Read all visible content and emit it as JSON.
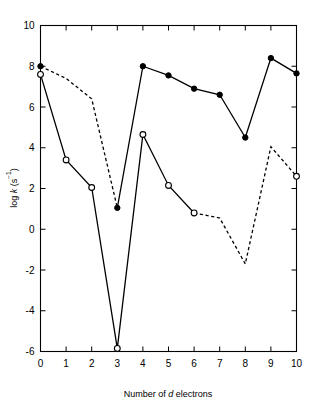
{
  "chart_data": {
    "type": "line",
    "title": "",
    "xlabel": "Number of d electrons",
    "xlabel_parts": {
      "prefix": "Number of ",
      "italic": "d",
      "suffix": " electrons"
    },
    "ylabel": "log k (s−1)",
    "ylabel_parts": {
      "prefix": "log ",
      "italic": "k",
      "suffix": " (s"
    },
    "ylabel_superscript": "−1",
    "ylabel_close": ")",
    "xlim": [
      0,
      10
    ],
    "ylim": [
      -6,
      10
    ],
    "xticks": [
      0,
      1,
      2,
      3,
      4,
      5,
      6,
      7,
      8,
      9,
      10
    ],
    "yticks": [
      10,
      8,
      6,
      4,
      2,
      0,
      -2,
      -4,
      -6
    ],
    "xtick_labels": [
      "0",
      "1",
      "2",
      "3",
      "4",
      "5",
      "6",
      "7",
      "8",
      "9",
      "10"
    ],
    "ytick_labels": [
      "10",
      "8",
      "6",
      "4",
      "2",
      "0",
      "-2",
      "-4",
      "-6"
    ],
    "grid": false,
    "legend": "none",
    "frame": "box",
    "tick_direction": "in",
    "x": [
      0,
      1,
      2,
      3,
      4,
      5,
      6,
      7,
      8,
      9,
      10
    ],
    "series": [
      {
        "name": "filled-circle-series",
        "marker": "filled-circle",
        "linestyle_segments": [
          {
            "from_x": 0,
            "to_x": 3,
            "style": "dashed"
          },
          {
            "from_x": 3,
            "to_x": 10,
            "style": "solid"
          }
        ],
        "points": [
          {
            "x": 0,
            "y": 8.0,
            "marker": true
          },
          {
            "x": 1,
            "y": 7.4,
            "marker": false
          },
          {
            "x": 2,
            "y": 6.4,
            "marker": false
          },
          {
            "x": 3,
            "y": 1.05,
            "marker": true
          },
          {
            "x": 4,
            "y": 8.0,
            "marker": true
          },
          {
            "x": 5,
            "y": 7.55,
            "marker": true
          },
          {
            "x": 6,
            "y": 6.9,
            "marker": true
          },
          {
            "x": 7,
            "y": 6.6,
            "marker": true
          },
          {
            "x": 8,
            "y": 4.5,
            "marker": true
          },
          {
            "x": 9,
            "y": 8.4,
            "marker": true
          },
          {
            "x": 10,
            "y": 7.65,
            "marker": true
          }
        ]
      },
      {
        "name": "open-circle-series",
        "marker": "open-circle",
        "linestyle_segments": [
          {
            "from_x": 0,
            "to_x": 6,
            "style": "solid"
          },
          {
            "from_x": 6,
            "to_x": 10,
            "style": "dashed"
          }
        ],
        "points": [
          {
            "x": 0,
            "y": 7.6,
            "marker": true
          },
          {
            "x": 1,
            "y": 3.4,
            "marker": true
          },
          {
            "x": 2,
            "y": 2.05,
            "marker": true
          },
          {
            "x": 3,
            "y": -5.85,
            "marker": true
          },
          {
            "x": 4,
            "y": 4.65,
            "marker": true
          },
          {
            "x": 5,
            "y": 2.15,
            "marker": true
          },
          {
            "x": 6,
            "y": 0.8,
            "marker": true
          },
          {
            "x": 7,
            "y": 0.55,
            "marker": false
          },
          {
            "x": 8,
            "y": -1.7,
            "marker": false
          },
          {
            "x": 9,
            "y": 4.05,
            "marker": false
          },
          {
            "x": 10,
            "y": 2.6,
            "marker": true
          }
        ]
      }
    ]
  }
}
